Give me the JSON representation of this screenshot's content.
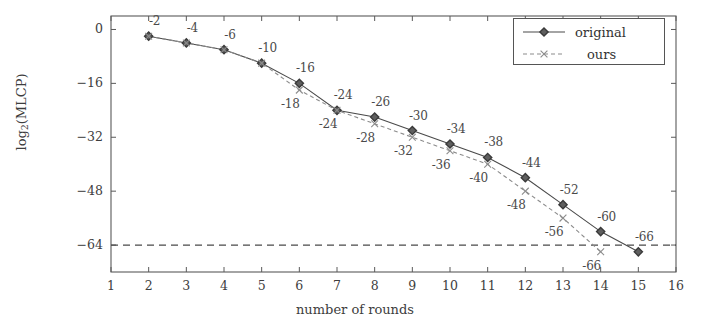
{
  "chart_data": {
    "type": "line",
    "title": "",
    "xlabel": "number of rounds",
    "ylabel": "log2(MLCP)",
    "ylabel_base": "log",
    "ylabel_sub": "2",
    "ylabel_tail": "(MLCP)",
    "xlim": [
      1,
      16
    ],
    "ylim": [
      -72,
      4
    ],
    "xticks": [
      "1",
      "2",
      "3",
      "4",
      "5",
      "6",
      "7",
      "8",
      "9",
      "10",
      "11",
      "12",
      "13",
      "14",
      "15",
      "16"
    ],
    "xtick_values": [
      1,
      2,
      3,
      4,
      5,
      6,
      7,
      8,
      9,
      10,
      11,
      12,
      13,
      14,
      15,
      16
    ],
    "yticks": [
      "0",
      "−16",
      "−32",
      "−48",
      "−64"
    ],
    "ytick_values": [
      0,
      -16,
      -32,
      -48,
      -64
    ],
    "grid": false,
    "legend_position": "top-right",
    "threshold_line": {
      "value": -64,
      "style": "dashed",
      "color": "#4a4a4a"
    },
    "series": [
      {
        "name": "original",
        "marker": "diamond",
        "color": "#4a4a4a",
        "linestyle": "solid",
        "x": [
          2,
          3,
          4,
          5,
          6,
          7,
          8,
          9,
          10,
          11,
          12,
          13,
          14,
          15
        ],
        "values": [
          -2,
          -4,
          -6,
          -10,
          -16,
          -24,
          -26,
          -30,
          -34,
          -38,
          -44,
          -52,
          -60,
          -66
        ],
        "labels": [
          "-2",
          "-4",
          "-6",
          "-10",
          "-16",
          "-24",
          "-26",
          "-30",
          "-34",
          "-38",
          "-44",
          "-52",
          "-60",
          "-66"
        ],
        "label_position": "above"
      },
      {
        "name": "ours",
        "marker": "cross",
        "color": "#8c8c8c",
        "linestyle": "dashed",
        "x": [
          2,
          3,
          4,
          5,
          6,
          7,
          8,
          9,
          10,
          11,
          12,
          13,
          14
        ],
        "values": [
          -2,
          -4,
          -6,
          -10,
          -18,
          -24,
          -28,
          -32,
          -36,
          -40,
          -48,
          -56,
          -66
        ],
        "labels": [
          "",
          "",
          "",
          "",
          "-18",
          "-24",
          "-28",
          "-32",
          "-36",
          "-40",
          "-48",
          "-56",
          "-66"
        ],
        "label_position": "below"
      }
    ]
  },
  "legend": {
    "entries": [
      {
        "label": "original",
        "marker": "diamond"
      },
      {
        "label": "ours",
        "marker": "cross"
      }
    ]
  }
}
